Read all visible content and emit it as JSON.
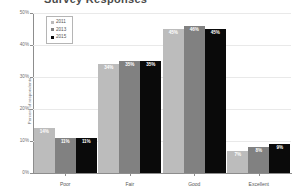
{
  "title": "Survey Responses",
  "chart_data": {
    "type": "bar",
    "title": "",
    "xlabel": "",
    "ylabel": "Percent of respondents",
    "ylim": [
      0,
      50
    ],
    "yticks": [
      0,
      10,
      20,
      30,
      40,
      50
    ],
    "ytick_labels": [
      "0%",
      "10%",
      "20%",
      "30%",
      "40%",
      "50%"
    ],
    "grid": true,
    "legend_position": "top-left",
    "categories": [
      "Poor",
      "Fair",
      "Good",
      "Excellent"
    ],
    "series": [
      {
        "name": "2011",
        "color": "#bcbcbc",
        "values": [
          14,
          34,
          45,
          7
        ],
        "labels": [
          "14%",
          "34%",
          "45%",
          "7%"
        ]
      },
      {
        "name": "2013",
        "color": "#818181",
        "values": [
          11,
          35,
          46,
          8
        ],
        "labels": [
          "11%",
          "35%",
          "46%",
          "8%"
        ]
      },
      {
        "name": "2015",
        "color": "#0a0a0a",
        "values": [
          11,
          35,
          45,
          9
        ],
        "labels": [
          "11%",
          "35%",
          "45%",
          "9%"
        ]
      }
    ]
  }
}
